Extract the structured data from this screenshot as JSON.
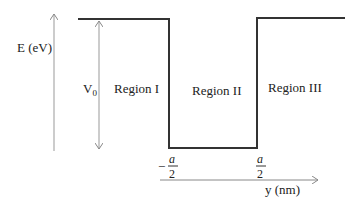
{
  "diagram": {
    "type": "finite-potential-well",
    "y_axis_label": "E (eV)",
    "x_axis_label": "y (nm)",
    "barrier_label": "V",
    "barrier_subscript": "0",
    "regions": [
      {
        "label": "Region I"
      },
      {
        "label": "Region II"
      },
      {
        "label": "Region III"
      }
    ],
    "boundaries": [
      {
        "sign": "−",
        "numerator": "a",
        "denominator": "2"
      },
      {
        "sign": "",
        "numerator": "a",
        "denominator": "2"
      }
    ],
    "colors": {
      "potential_line": "#333333",
      "axis": "#888888",
      "text": "#222222"
    }
  }
}
